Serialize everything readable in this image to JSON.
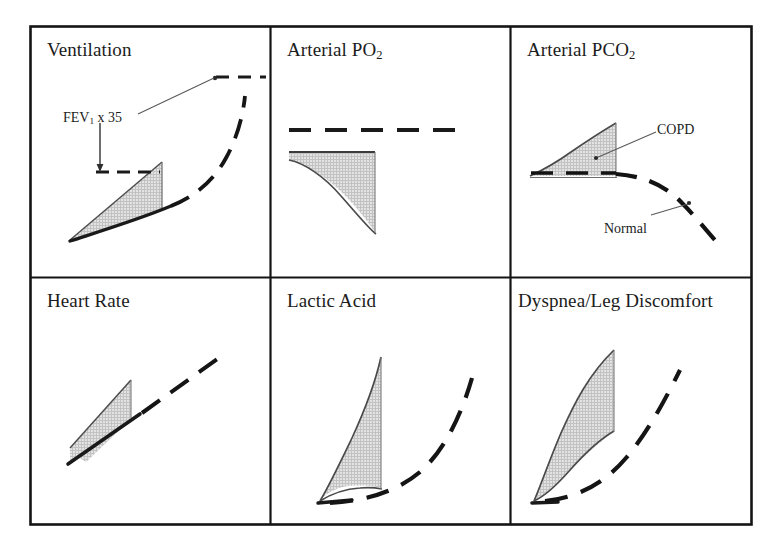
{
  "figure": {
    "kind": "six-panel-physiology-diagram",
    "colors": {
      "ink": "#1c1c1c",
      "border": "#141414",
      "shade_fill": "#d4d4d4",
      "shade_edge": "#4a4a4a",
      "dash_line": "#151515",
      "leader_line": "#555555"
    },
    "frame": {
      "x": 30,
      "y": 26,
      "width": 722,
      "height": 499
    },
    "dividers": {
      "vertical_x": [
        270,
        510
      ],
      "horizontal_y": [
        277
      ]
    }
  },
  "panels": [
    {
      "id": "ventilation",
      "title": "Ventilation",
      "title_sub": "",
      "row": 1,
      "col": 1,
      "copd_shape": "widening-wedge-rising",
      "normal_shape": "rising-curve-dashed",
      "annotations": [
        {
          "id": "fev1",
          "text_pre": "FEV",
          "text_sub": "1",
          "text_post": " x 35"
        }
      ]
    },
    {
      "id": "arterial-po2",
      "title": "Arterial PO",
      "title_sub": "2",
      "row": 1,
      "col": 2,
      "copd_shape": "falling-wedge-shaded",
      "normal_shape": "flat-dashed-plateau",
      "annotations": []
    },
    {
      "id": "arterial-pco2",
      "title": "Arterial PCO",
      "title_sub": "2",
      "row": 1,
      "col": 3,
      "copd_shape": "rising-wedge-shaded",
      "normal_shape": "flat-then-falling-dashed",
      "annotations": [
        {
          "id": "copd",
          "text_pre": "COPD",
          "text_sub": "",
          "text_post": ""
        },
        {
          "id": "normal",
          "text_pre": "Normal",
          "text_sub": "",
          "text_post": ""
        }
      ]
    },
    {
      "id": "heart-rate",
      "title": "Heart Rate",
      "title_sub": "",
      "row": 2,
      "col": 1,
      "copd_shape": "linear-band-shaded",
      "normal_shape": "linear-dashed",
      "annotations": []
    },
    {
      "id": "lactic-acid",
      "title": "Lactic Acid",
      "title_sub": "",
      "row": 2,
      "col": 2,
      "copd_shape": "steep-exponential-wedge",
      "normal_shape": "delayed-exponential-dashed",
      "annotations": []
    },
    {
      "id": "dyspnea-leg-discomfort",
      "title": "Dyspnea/Leg Discomfort",
      "title_sub": "",
      "row": 2,
      "col": 3,
      "copd_shape": "steep-exponential-wedge",
      "normal_shape": "delayed-exponential-dashed",
      "annotations": []
    }
  ],
  "legend": {
    "copd_label": "COPD",
    "normal_label": "Normal",
    "copd_style": "solid-edged shaded band",
    "normal_style": "thick dashed line"
  }
}
